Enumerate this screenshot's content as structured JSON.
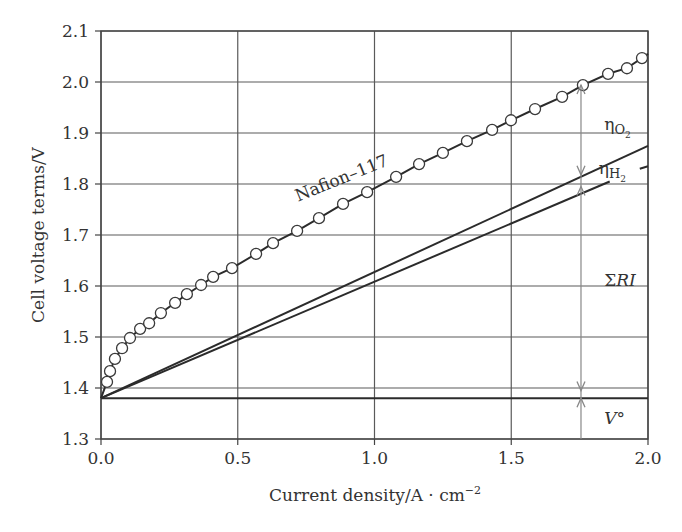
{
  "chart_data": {
    "type": "line",
    "title": "",
    "xlabel": "Current density/A · cm",
    "xlabel_sup": "−2",
    "ylabel": "Cell voltage terms/V",
    "xlim": [
      0.0,
      2.0
    ],
    "ylim": [
      1.3,
      2.1
    ],
    "grid": true,
    "x_ticks": [
      0.0,
      0.5,
      1.0,
      1.5,
      2.0
    ],
    "x_tick_labels": [
      "0.0",
      "0.5",
      "1.0",
      "1.5",
      "2.0"
    ],
    "y_ticks": [
      1.3,
      1.4,
      1.5,
      1.6,
      1.7,
      1.8,
      1.9,
      2.0,
      2.1
    ],
    "y_tick_labels": [
      "1.3",
      "1.4",
      "1.5",
      "1.6",
      "1.7",
      "1.8",
      "1.9",
      "2.0",
      "2.1"
    ],
    "series": [
      {
        "name": "Nafion–117",
        "style": "line+open-circles",
        "x": [
          0.0,
          0.022,
          0.033,
          0.051,
          0.077,
          0.106,
          0.143,
          0.176,
          0.219,
          0.271,
          0.314,
          0.366,
          0.41,
          0.479,
          0.567,
          0.629,
          0.717,
          0.797,
          0.885,
          0.973,
          1.079,
          1.163,
          1.25,
          1.338,
          1.43,
          1.499,
          1.587,
          1.686,
          1.762,
          1.854,
          1.923,
          1.978,
          2.0
        ],
        "y": [
          1.38,
          1.412,
          1.433,
          1.457,
          1.478,
          1.498,
          1.516,
          1.527,
          1.547,
          1.567,
          1.584,
          1.602,
          1.618,
          1.635,
          1.663,
          1.684,
          1.708,
          1.733,
          1.761,
          1.784,
          1.814,
          1.839,
          1.861,
          1.884,
          1.906,
          1.925,
          1.947,
          1.971,
          1.994,
          2.016,
          2.027,
          2.047,
          2.055
        ],
        "markers_from_index": 1,
        "markers_to_index": 31
      },
      {
        "name": "V° + ΣRI + ηH2",
        "style": "line",
        "x": [
          0.0,
          2.0
        ],
        "y": [
          1.38,
          1.875
        ]
      },
      {
        "name": "V° + ΣRI",
        "style": "line",
        "x": [
          0.0,
          1.86
        ],
        "y": [
          1.38,
          1.805
        ]
      },
      {
        "name": "V° + ΣRI (continuation)",
        "style": "line",
        "x": [
          1.97,
          2.0
        ],
        "y": [
          1.83,
          1.835
        ]
      },
      {
        "name": "V°",
        "style": "line",
        "x": [
          0.0,
          2.0
        ],
        "y": [
          1.38,
          1.38
        ]
      }
    ],
    "annotations": [
      {
        "text": "Nafion–117",
        "x": 0.72,
        "y": 1.765,
        "rotation": -22
      },
      {
        "text": "η",
        "sub": "O2",
        "x": 1.84,
        "y": 1.905
      },
      {
        "text": "η",
        "sub": "H2",
        "x": 1.82,
        "y": 1.82
      },
      {
        "text": "ΣRI",
        "x": 1.84,
        "y": 1.6
      },
      {
        "text": "V°",
        "x": 1.84,
        "y": 1.33
      }
    ],
    "arrow_x": 1.755,
    "arrow_marks_y": [
      1.994,
      1.818,
      1.795,
      1.395,
      1.38
    ]
  }
}
